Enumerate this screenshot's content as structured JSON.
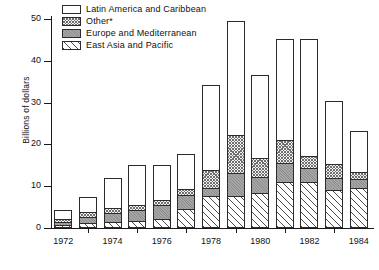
{
  "chart_data": {
    "type": "bar",
    "subtype": "stacked-bar",
    "title": "",
    "xlabel": "",
    "ylabel": "Billions of dollars",
    "ylim": [
      0,
      50
    ],
    "yticks": [
      0,
      10,
      20,
      30,
      40,
      50
    ],
    "grid": false,
    "legend_position": "top-left",
    "categories": [
      "1972",
      "1973",
      "1974",
      "1975",
      "1976",
      "1977",
      "1978",
      "1979",
      "1980",
      "1981",
      "1982",
      "1983",
      "1984"
    ],
    "xtick_labels": [
      "1972",
      "1974",
      "1976",
      "1978",
      "1980",
      "1982",
      "1984"
    ],
    "series": [
      {
        "name": "East Asia and Pacific",
        "pattern": "diagonal-stripes",
        "values": [
          0.8,
          1.2,
          1.5,
          1.7,
          2.2,
          4.6,
          7.6,
          7.6,
          8.3,
          11.0,
          11.0,
          9.0,
          9.6
        ]
      },
      {
        "name": "Europe and Mediterranean",
        "pattern": "solid-gray",
        "values": [
          0.7,
          1.5,
          2.0,
          2.7,
          3.4,
          3.3,
          2.0,
          5.6,
          4.0,
          4.5,
          3.4,
          3.0,
          2.2
        ]
      },
      {
        "name": "Other*",
        "pattern": "crosshatch",
        "values": [
          0.7,
          1.2,
          1.3,
          1.2,
          1.2,
          1.5,
          4.3,
          9.1,
          4.5,
          5.5,
          2.8,
          3.4,
          1.5
        ]
      },
      {
        "name": "Latin America and Caribbean",
        "pattern": "dotted",
        "values": [
          2.1,
          3.6,
          7.2,
          9.4,
          8.2,
          8.2,
          20.3,
          27.2,
          19.8,
          24.3,
          28.1,
          15.1,
          9.8
        ]
      }
    ],
    "totals": [
      4.3,
      7.5,
      12.0,
      15.0,
      15.0,
      17.6,
      34.2,
      49.5,
      36.6,
      45.3,
      45.3,
      30.5,
      23.1
    ]
  },
  "legend": {
    "items": [
      {
        "label": "Latin America and Caribbean",
        "key": "latin"
      },
      {
        "label": "Other*",
        "key": "other"
      },
      {
        "label": "Europe and Mediterranean",
        "key": "europe"
      },
      {
        "label": "East Asia and Pacific",
        "key": "asia"
      }
    ]
  },
  "axis": {
    "y_title": "Billions of dollars"
  },
  "colors": {
    "axis": "#1a1a1a",
    "outline": "#2b2b2b",
    "europe_fill": "#a6a6a6",
    "background": "#ffffff"
  }
}
